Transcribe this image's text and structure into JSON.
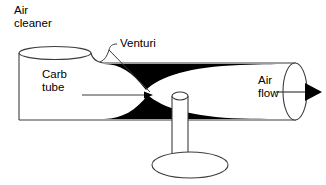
{
  "diagram": {
    "labels": {
      "air_cleaner": {
        "line1": "Air",
        "line2": "cleaner"
      },
      "venturi": {
        "line1": "Venturi"
      },
      "carb_tube": {
        "line1": "Carb",
        "line2": "tube"
      },
      "air_flow": {
        "line1": "Air",
        "line2": "flow"
      }
    },
    "colors": {
      "outline": "#3c3c3c",
      "fill_restriction": "#000000",
      "background": "#ffffff",
      "text": "#000000"
    },
    "parts": [
      {
        "name": "air-cleaner-cylinder",
        "shape": "cylinder"
      },
      {
        "name": "carb-tube-body",
        "shape": "tube"
      },
      {
        "name": "venturi-restriction-upper",
        "shape": "crescent"
      },
      {
        "name": "venturi-restriction-lower",
        "shape": "crescent"
      },
      {
        "name": "fuel-jet-stem",
        "shape": "stem"
      },
      {
        "name": "fuel-jet-base",
        "shape": "ellipse"
      },
      {
        "name": "air-flow-arrow",
        "shape": "arrow"
      },
      {
        "name": "venturi-leader-line",
        "shape": "leader"
      },
      {
        "name": "carb-tube-leader-arrow",
        "shape": "leader-arrow"
      },
      {
        "name": "tube-outlet-ellipse",
        "shape": "ellipse"
      }
    ]
  }
}
